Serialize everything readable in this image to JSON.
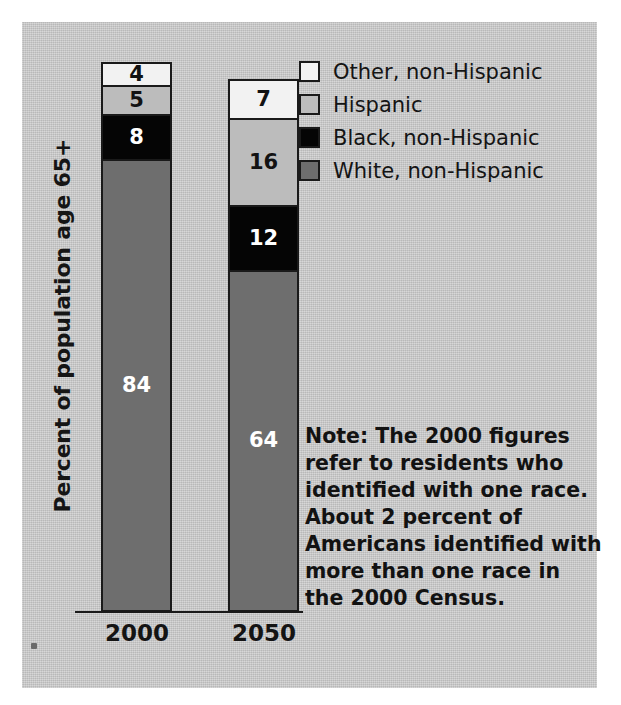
{
  "chart_data": {
    "type": "bar",
    "subtype": "stacked-bar",
    "title": "",
    "xlabel": "",
    "ylabel": "Percent of population age 65+",
    "ylim": [
      0,
      100
    ],
    "grid": false,
    "legend_position": "top-right",
    "categories": [
      "2000",
      "2050"
    ],
    "series": [
      {
        "name": "Other, non-Hispanic",
        "color": "#f2f2f2",
        "values": [
          4,
          7
        ]
      },
      {
        "name": "Hispanic",
        "color": "#bcbcbc",
        "values": [
          5,
          16
        ]
      },
      {
        "name": "Black, non-Hispanic",
        "color": "#050505",
        "values": [
          8,
          12
        ]
      },
      {
        "name": "White, non-Hispanic",
        "color": "#6e6e6e",
        "values": [
          84,
          64
        ]
      }
    ],
    "bars": [
      {
        "category": "2000",
        "total": 101,
        "segments": [
          {
            "label": "Other, non-Hispanic",
            "value": "4",
            "color": "#f2f2f2",
            "text_color": "#121212"
          },
          {
            "label": "Hispanic",
            "value": "5",
            "color": "#bcbcbc",
            "text_color": "#121212"
          },
          {
            "label": "Black, non-Hispanic",
            "value": "8",
            "color": "#050505",
            "text_color": "#ffffff"
          },
          {
            "label": "White, non-Hispanic",
            "value": "84",
            "color": "#6e6e6e",
            "text_color": "#ffffff"
          }
        ]
      },
      {
        "category": "2050",
        "total": 99,
        "segments": [
          {
            "label": "Other, non-Hispanic",
            "value": "7",
            "color": "#f2f2f2",
            "text_color": "#121212"
          },
          {
            "label": "Hispanic",
            "value": "16",
            "color": "#bcbcbc",
            "text_color": "#121212"
          },
          {
            "label": "Black, non-Hispanic",
            "value": "12",
            "color": "#050505",
            "text_color": "#ffffff"
          },
          {
            "label": "White, non-Hispanic",
            "value": "64",
            "color": "#6e6e6e",
            "text_color": "#ffffff"
          }
        ]
      }
    ],
    "annotations": [
      "Note: The 2000 figures refer to residents who identified with one race. About 2 percent of Americans identified with more than one race in the 2000 Census."
    ]
  },
  "axis": {
    "y_label": "Percent of population age 65+",
    "tick_labels": [
      "2000",
      "2050"
    ]
  },
  "legend": {
    "items": [
      {
        "label": "Other, non-Hispanic",
        "color": "#f2f2f2"
      },
      {
        "label": "Hispanic",
        "color": "#bcbcbc"
      },
      {
        "label": "Black, non-Hispanic",
        "color": "#050505"
      },
      {
        "label": "White, non-Hispanic",
        "color": "#6e6e6e"
      }
    ]
  },
  "note": {
    "lines": [
      "Note: The 2000 figures",
      "refer to residents who",
      "identified with one race.",
      "About 2 percent of",
      "Americans identified with",
      "more than one race in",
      "the 2000 Census."
    ]
  },
  "colors": {
    "panel_background": "#c8c8c8",
    "page_background": "#ffffff",
    "ink": "#141414"
  }
}
